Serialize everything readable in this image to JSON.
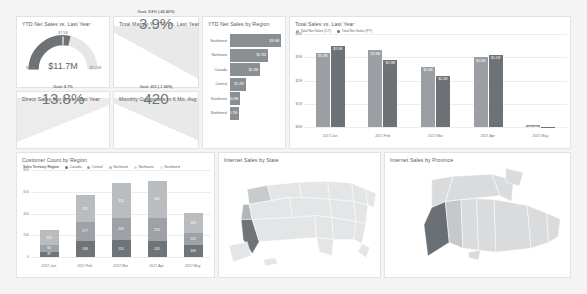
{
  "dashboard": {
    "background": "#f4f4f4"
  },
  "cards": {
    "gauge": {
      "title": "YTD Net Sales vs. Last Year",
      "value": "$11.7M",
      "min": "$0.0M",
      "max": "$15.5M",
      "target": "$7.5M"
    },
    "margin": {
      "title": "Total Margin % YTD vs. Last Year",
      "value": "3.9%",
      "goal": "Goal: 8.8% (-42.40%)"
    },
    "direct_mix": {
      "title": "Direct Sales Mix % vs. Last Year",
      "value": "13.8%",
      "goal": "Goal: 8.7%"
    },
    "customers": {
      "title": "Monthly Customers in 6 Mo. Avg",
      "value": "420",
      "goal": "Goal: 412 (-1.94%)"
    }
  },
  "chart_data": [
    {
      "type": "bar",
      "orientation": "horizontal",
      "title": "YTD Net Sales by Region",
      "categories": [
        "Southwest",
        "Northeast",
        "Canada",
        "Central",
        "Southeast",
        "Northwest"
      ],
      "values": [
        3.9,
        2.9,
        2.3,
        1.2,
        0.8,
        0.7
      ],
      "labels": [
        "$3.9M",
        "$2.9M",
        "$2.3M",
        "$1.2M",
        "$0.8M",
        "$0.7M"
      ],
      "xlabel": "",
      "ylabel": "",
      "bar_color": "#8a8f93"
    },
    {
      "type": "bar",
      "orientation": "vertical",
      "title": "Total Sales vs. Last Year",
      "categories": [
        "2017-Jan",
        "2017-Feb",
        "2017-Mar",
        "2017-Apr",
        "2017-May"
      ],
      "series": [
        {
          "name": "Total Net Sales (CY)",
          "color": "#9b9fa3",
          "values": [
            3.2,
            3.3,
            2.6,
            3.0,
            0.1
          ],
          "labels": [
            "$3.2M",
            "$3.3M",
            "$2.6M",
            "$3.0M",
            "$0.1M"
          ]
        },
        {
          "name": "Total Net Sales (PY)",
          "color": "#6d7276",
          "values": [
            3.5,
            2.9,
            2.2,
            3.1,
            0.02
          ],
          "labels": [
            "$3.5M",
            "$2.9M",
            "$2.2M",
            "$3.1M",
            ""
          ]
        }
      ],
      "yticks": [
        "$4M",
        "$3M",
        "$2M",
        "$1M",
        "$0M"
      ],
      "ylim": [
        0,
        4
      ],
      "grid": true,
      "legend_position": "top-left"
    },
    {
      "type": "bar",
      "orientation": "vertical",
      "stacked": true,
      "title": "Customer Count by Region",
      "legend_title": "Sales Territory Region",
      "categories": [
        "2017-Jan",
        "2017-Feb",
        "2017-Mar",
        "2017-Apr",
        "2017-May"
      ],
      "series": [
        {
          "name": "Canada",
          "color": "#6f7478",
          "values": [
            47,
            148,
            155,
            145,
            109
          ],
          "labels": [
            "47",
            "148",
            "155",
            "145",
            "109"
          ]
        },
        {
          "name": "Central",
          "color": "#9ea2a6",
          "values": [
            66,
            177,
            200,
            214,
            112
          ],
          "labels": [
            "66",
            "177",
            "200",
            "214",
            "112"
          ]
        },
        {
          "name": "Northeast",
          "color": "#b9bdc0",
          "values": [
            131,
            241,
            324,
            341,
            182
          ],
          "labels": [
            "131",
            "241",
            "324",
            "341",
            "182"
          ]
        },
        {
          "name": "Northwest",
          "color": "#d2d5d7",
          "values": [
            0,
            0,
            0,
            0,
            0
          ],
          "labels": [
            "",
            "",
            "",
            "",
            ""
          ]
        },
        {
          "name": "Southwest",
          "color": "#e2e4e6",
          "values": [
            0,
            0,
            0,
            0,
            0
          ],
          "labels": [
            "",
            "",
            "",
            "",
            ""
          ]
        }
      ],
      "yticks": [
        "800",
        "600",
        "400",
        "200",
        "0"
      ],
      "ylim": [
        0,
        800
      ],
      "grid": true
    },
    {
      "type": "heatmap",
      "subtype": "choropleth",
      "title": "Internet Sales by State",
      "region": "United States",
      "highlight": [
        "California",
        "Washington",
        "Oregon"
      ],
      "base_color": "#e3e5e6",
      "highlight_color": "#6e7478"
    },
    {
      "type": "heatmap",
      "subtype": "choropleth",
      "title": "Internet Sales by Province",
      "region": "Canada",
      "highlight": [
        "British Columbia"
      ],
      "base_color": "#d9dbdd",
      "highlight_color": "#6a6f73"
    }
  ]
}
